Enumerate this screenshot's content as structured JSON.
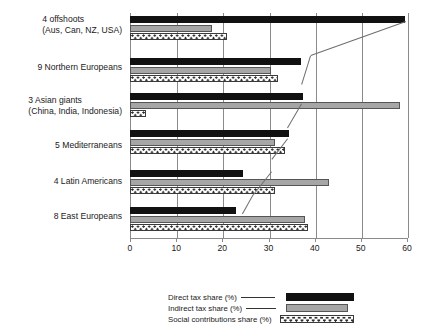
{
  "chart_data": {
    "type": "bar",
    "orientation": "horizontal",
    "title": "",
    "xlabel": "",
    "ylabel": "",
    "xlim": [
      0,
      60
    ],
    "xticks": [
      "0",
      "10",
      "20",
      "30",
      "40",
      "50",
      "60"
    ],
    "grid": true,
    "legend_position": "bottom",
    "categories": [
      "4 offshoots (Aus, Can, NZ, USA)",
      "9 Northern Europeans",
      "3 Asian giants (China, India, Indonesia)",
      "5 Mediterraneans",
      "4 Latin Americans",
      "8 East Europeans"
    ],
    "category_lines": [
      [
        "4 offshoots",
        "(Aus, Can, NZ, USA)"
      ],
      [
        "9 Northern Europeans",
        ""
      ],
      [
        "3 Asian giants",
        "(China, India, Indonesia)"
      ],
      [
        "5 Mediterraneans",
        ""
      ],
      [
        "4 Latin Americans",
        ""
      ],
      [
        "8 East Europeans",
        ""
      ]
    ],
    "series": [
      {
        "name": "Direct tax share (%)",
        "color": "#111111",
        "values": [
          59.5,
          37.0,
          37.5,
          34.5,
          24.5,
          23.0
        ]
      },
      {
        "name": "Indirect tax share (%)",
        "color": "#a6a6a6",
        "values": [
          17.7,
          30.5,
          58.5,
          31.5,
          43.0,
          38.0
        ]
      },
      {
        "name": "Social contributions share (%)",
        "color": "#ffffff",
        "values": [
          21.0,
          32.0,
          3.5,
          33.5,
          31.5,
          38.5
        ]
      }
    ]
  },
  "legend": {
    "entries": [
      {
        "label": "Direct tax share (%)",
        "swatch": "direct"
      },
      {
        "label": "Indirect tax share (%)",
        "swatch": "indirect"
      },
      {
        "label": "Social contributions share (%)",
        "swatch": "social"
      }
    ]
  }
}
